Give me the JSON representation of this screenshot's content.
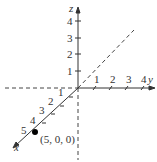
{
  "diagram": {
    "type": "3d-coordinate-axes",
    "axes": {
      "x": {
        "label": "x",
        "ticks": [
          "1",
          "2",
          "3",
          "4",
          "5"
        ]
      },
      "y": {
        "label": "y",
        "ticks": [
          "1",
          "2",
          "3",
          "4"
        ]
      },
      "z": {
        "label": "z",
        "ticks": [
          "1",
          "2",
          "3",
          "4"
        ]
      }
    },
    "point": {
      "label": "(5, 0, 0)",
      "coords": [
        5,
        0,
        0
      ]
    },
    "colors": {
      "axis": "#333333",
      "dashed": "#444444",
      "point": "#000000"
    }
  }
}
